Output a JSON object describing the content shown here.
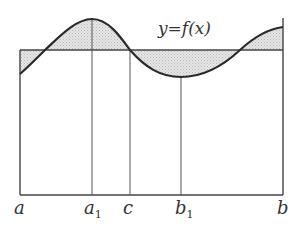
{
  "figure": {
    "function_label": "y=f(x)",
    "x_labels": {
      "a": "a",
      "a1_base": "a",
      "a1_sub": "1",
      "c": "c",
      "b1_base": "b",
      "b1_sub": "1",
      "b": "b"
    },
    "colors": {
      "line": "#333333",
      "curve": "#2a2a2a",
      "fill": "#d9d9d9",
      "background": "#ffffff"
    }
  }
}
